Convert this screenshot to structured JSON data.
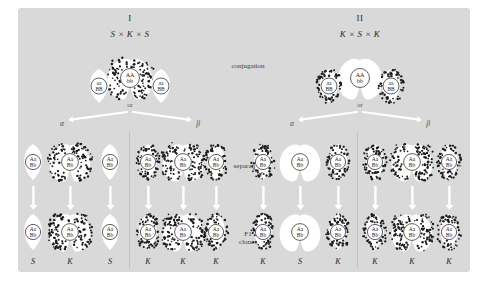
{
  "figure": {
    "background_color": "#d9d9d9",
    "page_color": "#ffffff",
    "stipple_color": "#1c1c1c",
    "cell_white": "#ffffff",
    "cell_stippled_fill": "#ffffff"
  },
  "center_labels": {
    "conjugation": "conjugation",
    "separation": "separation",
    "f1_line1": "F1",
    "f1_line2": "clones"
  },
  "panels": [
    {
      "id": "panel-1",
      "roman": "I",
      "cross": "S × K × S",
      "or_label": "or",
      "branch_left": "α",
      "branch_right": "β",
      "conjugation": {
        "left_cell": {
          "stippled": false,
          "nucleus_line1": "aa",
          "nucleus_line2": "BB"
        },
        "center_cell": {
          "stippled": true,
          "nucleus_line1": "AA",
          "nucleus_line2": "bb"
        },
        "right_cell": {
          "stippled": false,
          "nucleus_line1": "aa",
          "nucleus_line2": "BB"
        }
      },
      "separation": [
        {
          "shape": "single",
          "stippled": false,
          "nucleus_line1": "Aa",
          "nucleus_line2": "Bb"
        },
        {
          "shape": "double",
          "stippled": true,
          "nucleus_line1": "Aa",
          "nucleus_line2": "Bb"
        },
        {
          "shape": "single",
          "stippled": false,
          "nucleus_line1": "Aa",
          "nucleus_line2": "Bb"
        },
        {
          "shape": "single",
          "stippled": true,
          "nucleus_line1": "Aa",
          "nucleus_line2": "Bb"
        },
        {
          "shape": "double",
          "stippled": true,
          "nucleus_line1": "Aa",
          "nucleus_line2": "Bb"
        },
        {
          "shape": "single",
          "stippled": true,
          "nucleus_line1": "Aa",
          "nucleus_line2": "Bb"
        }
      ],
      "f1_clones": [
        {
          "shape": "single",
          "stippled": false,
          "nucleus_line1": "Aa",
          "nucleus_line2": "Bb",
          "phenotype": "S"
        },
        {
          "shape": "double",
          "stippled": true,
          "nucleus_line1": "Aa",
          "nucleus_line2": "Bb",
          "phenotype": "K"
        },
        {
          "shape": "single",
          "stippled": false,
          "nucleus_line1": "Aa",
          "nucleus_line2": "Bb",
          "phenotype": "S"
        },
        {
          "shape": "single",
          "stippled": true,
          "nucleus_line1": "Aa",
          "nucleus_line2": "Bb",
          "phenotype": "K"
        },
        {
          "shape": "double",
          "stippled": true,
          "nucleus_line1": "Aa",
          "nucleus_line2": "Bb",
          "phenotype": "K"
        },
        {
          "shape": "single",
          "stippled": true,
          "nucleus_line1": "Aa",
          "nucleus_line2": "Bb",
          "phenotype": "K"
        }
      ]
    },
    {
      "id": "panel-2",
      "roman": "II",
      "cross": "K × S × K",
      "or_label": "or",
      "branch_left": "α",
      "branch_right": "β",
      "conjugation": {
        "left_cell": {
          "stippled": true,
          "nucleus_line1": "aa",
          "nucleus_line2": "BB"
        },
        "center_cell": {
          "stippled": false,
          "nucleus_line1": "AA",
          "nucleus_line2": "bb"
        },
        "right_cell": {
          "stippled": true,
          "nucleus_line1": "aa",
          "nucleus_line2": "BB"
        }
      },
      "separation": [
        {
          "shape": "single",
          "stippled": true,
          "nucleus_line1": "Aa",
          "nucleus_line2": "Bb"
        },
        {
          "shape": "double",
          "stippled": false,
          "nucleus_line1": "Aa",
          "nucleus_line2": "Bb"
        },
        {
          "shape": "single",
          "stippled": true,
          "nucleus_line1": "Aa",
          "nucleus_line2": "Bb"
        },
        {
          "shape": "single",
          "stippled": true,
          "nucleus_line1": "Aa",
          "nucleus_line2": "Bb"
        },
        {
          "shape": "double",
          "stippled": true,
          "nucleus_line1": "Aa",
          "nucleus_line2": "Bb"
        },
        {
          "shape": "single",
          "stippled": true,
          "nucleus_line1": "Aa",
          "nucleus_line2": "Bb"
        }
      ],
      "f1_clones": [
        {
          "shape": "single",
          "stippled": true,
          "nucleus_line1": "Aa",
          "nucleus_line2": "Bb",
          "phenotype": "K"
        },
        {
          "shape": "double",
          "stippled": false,
          "nucleus_line1": "Aa",
          "nucleus_line2": "Bb",
          "phenotype": "S"
        },
        {
          "shape": "single",
          "stippled": true,
          "nucleus_line1": "Aa",
          "nucleus_line2": "Bb",
          "phenotype": "K"
        },
        {
          "shape": "single",
          "stippled": true,
          "nucleus_line1": "Aa",
          "nucleus_line2": "Bb",
          "phenotype": "K"
        },
        {
          "shape": "double",
          "stippled": true,
          "nucleus_line1": "Aa",
          "nucleus_line2": "Bb",
          "phenotype": "K"
        },
        {
          "shape": "single",
          "stippled": true,
          "nucleus_line1": "Aa",
          "nucleus_line2": "Bb",
          "phenotype": "K"
        }
      ]
    }
  ],
  "layout": {
    "panel_centers_x": [
      130,
      360
    ],
    "row_y": {
      "conjugation": 78,
      "separation": 162,
      "f1": 232
    },
    "phenotype_y": 262,
    "separation_cols_x": [
      [
        33,
        70,
        110,
        148,
        183,
        216
      ],
      [
        263,
        300,
        338,
        375,
        412,
        449
      ]
    ]
  }
}
